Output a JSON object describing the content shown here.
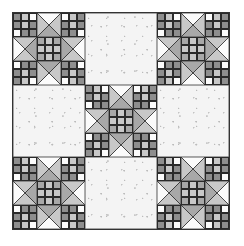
{
  "image": {
    "description": "Quilt block pattern: 3x3 layout with star blocks at corners and center, plain speckled blocks in between",
    "layout": {
      "rows": 3,
      "cols": 3,
      "blocks": [
        [
          "star",
          "plain",
          "star"
        ],
        [
          "plain",
          "star",
          "plain"
        ],
        [
          "star",
          "plain",
          "star"
        ]
      ]
    },
    "colors": {
      "dark": "#8e8e8e",
      "medium": "#a8a8a8",
      "light": "#c8c8c8",
      "white": "#fbfbfb",
      "background": "#f4f4f4",
      "line": "#2a2a2a"
    },
    "star_block": {
      "corner_ninepatch": [
        [
          "d",
          "l",
          "w"
        ],
        [
          "d",
          "l",
          "d"
        ],
        [
          "w",
          "d",
          "d"
        ]
      ],
      "center_ninepatch": [
        [
          "m",
          "l",
          "m"
        ],
        [
          "l",
          "l",
          "l"
        ],
        [
          "m",
          "l",
          "m"
        ]
      ],
      "edge_unit": {
        "outer": "white",
        "sides": "light",
        "inner": "medium"
      }
    }
  }
}
